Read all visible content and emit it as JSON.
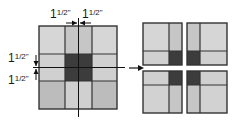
{
  "diagram": {
    "labels": {
      "top_left": "1",
      "top_left_frac": "1/2\"",
      "top_right": "1",
      "top_right_frac": "1/2\"",
      "side_top": "1",
      "side_top_frac": "1/2\"",
      "side_bottom": "1",
      "side_bottom_frac": "1/2\""
    },
    "dimension_text": [
      "1 1/2\"",
      "1 1/2\"",
      "1 1/2\"",
      "1 1/2\""
    ],
    "colors": {
      "light": "#d6d6d6",
      "medium": "#c6c6c6",
      "corner_dark": "#bcbcbc",
      "center": "#3c3c3c",
      "outline": "#333333"
    },
    "source_block": "nine-patch with cut lines",
    "result_blocks": [
      "top-left quarter",
      "top-right quarter",
      "bottom-left quarter",
      "bottom-right quarter"
    ]
  }
}
